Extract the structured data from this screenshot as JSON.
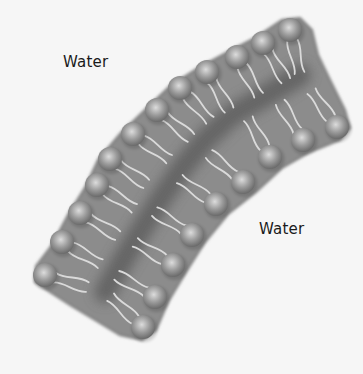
{
  "diagram": {
    "labels": [
      {
        "id": "water-top",
        "text": "Water",
        "x": 63,
        "y": 55
      },
      {
        "id": "water-bottom",
        "text": "Water",
        "x": 259,
        "y": 222
      }
    ],
    "colors": {
      "background": "#f6f6f6",
      "membrane": "#8c8c8c",
      "membrane_edge": "#7a7a7a",
      "core_band": "#5e5e5e",
      "head_light": "#dcdcdc",
      "head_mid": "#9a9a9a",
      "head_dark": "#6a6a6a",
      "tail": "#dadada",
      "label_text": "#1a1a1a"
    },
    "head_radius": 12,
    "outer_leaflet_heads": [
      [
        290,
        30
      ],
      [
        263,
        43
      ],
      [
        237,
        57
      ],
      [
        207,
        72
      ],
      [
        180,
        88
      ],
      [
        157,
        110
      ],
      [
        133,
        134
      ],
      [
        110,
        159
      ],
      [
        97,
        185
      ],
      [
        80,
        213
      ],
      [
        62,
        242
      ],
      [
        45,
        275
      ]
    ],
    "inner_leaflet_heads": [
      [
        337,
        127
      ],
      [
        303,
        140
      ],
      [
        270,
        157
      ],
      [
        243,
        182
      ],
      [
        216,
        204
      ],
      [
        192,
        235
      ],
      [
        173,
        265
      ],
      [
        155,
        297
      ],
      [
        143,
        327
      ]
    ],
    "membrane_outline": [
      [
        282,
        20
      ],
      [
        300,
        18
      ],
      [
        312,
        30
      ],
      [
        318,
        55
      ],
      [
        330,
        80
      ],
      [
        345,
        110
      ],
      [
        350,
        128
      ],
      [
        340,
        140
      ],
      [
        310,
        152
      ],
      [
        282,
        168
      ],
      [
        256,
        192
      ],
      [
        228,
        214
      ],
      [
        205,
        242
      ],
      [
        186,
        272
      ],
      [
        168,
        302
      ],
      [
        156,
        330
      ],
      [
        142,
        340
      ],
      [
        120,
        335
      ],
      [
        95,
        320
      ],
      [
        70,
        305
      ],
      [
        50,
        292
      ],
      [
        35,
        282
      ],
      [
        36,
        266
      ],
      [
        52,
        245
      ],
      [
        68,
        215
      ],
      [
        86,
        186
      ],
      [
        98,
        160
      ],
      [
        120,
        134
      ],
      [
        145,
        110
      ],
      [
        170,
        86
      ],
      [
        198,
        68
      ],
      [
        228,
        52
      ],
      [
        255,
        38
      ]
    ],
    "core_band": [
      [
        300,
        75
      ],
      [
        262,
        98
      ],
      [
        232,
        115
      ],
      [
        205,
        140
      ],
      [
        182,
        168
      ],
      [
        160,
        200
      ],
      [
        140,
        232
      ],
      [
        122,
        262
      ],
      [
        105,
        292
      ]
    ]
  }
}
